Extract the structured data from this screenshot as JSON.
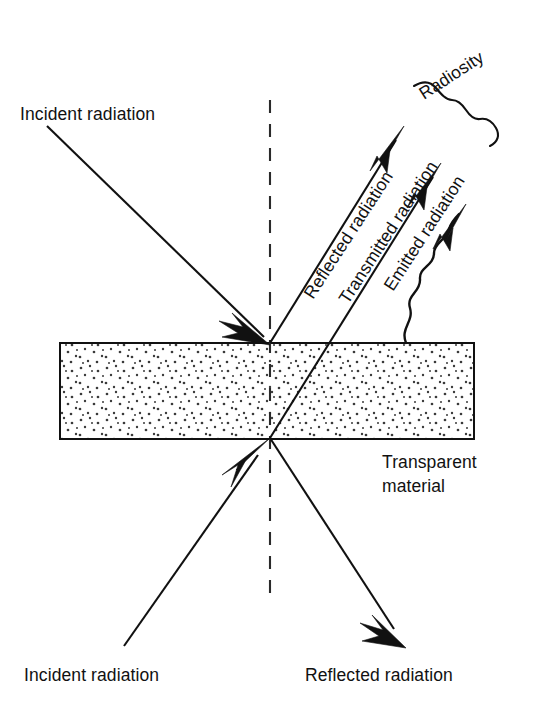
{
  "figure": {
    "background_color": "#ffffff",
    "ink_color": "#111111",
    "labels": {
      "incident_top": "Incident radiation",
      "incident_bottom": "Incident radiation",
      "reflected_top": "Reflected radiation",
      "transmitted": "Transmitted radiation",
      "emitted": "Emitted radiation",
      "radiosity": "Radiosity",
      "material_line1": "Transparent",
      "material_line2": "material",
      "reflected_bottom": "Reflected radiation"
    },
    "slab": {
      "name": "transparent-material-slab",
      "x": 60,
      "y": 343,
      "width": 414,
      "height": 96,
      "fill": "#ffffff",
      "stipple": "dotted"
    },
    "normal_line": {
      "name": "surface-normal-dashed",
      "x": 270,
      "y_top": 100,
      "y_bottom": 597,
      "style": "dashed"
    },
    "rays": [
      {
        "name": "incident-ray-top",
        "from": [
          47,
          126
        ],
        "to": [
          270,
          343
        ],
        "arrow": "at-end",
        "label": "Incident radiation"
      },
      {
        "name": "reflected-ray-top",
        "from": [
          270,
          343
        ],
        "to": [
          404,
          127
        ],
        "arrow": "at-end",
        "label": "Reflected radiation"
      },
      {
        "name": "transmitted-ray",
        "from": [
          270,
          438
        ],
        "to": [
          441,
          164
        ],
        "arrow": "at-end",
        "label": "Transmitted radiation"
      },
      {
        "name": "emitted-ray",
        "from": [
          406,
          343
        ],
        "to": [
          466,
          206
        ],
        "arrow": "at-end",
        "style": "wavy",
        "label": "Emitted radiation"
      },
      {
        "name": "incident-ray-bottom",
        "from": [
          124,
          646
        ],
        "to": [
          270,
          438
        ],
        "arrow": "at-end",
        "label": "Incident radiation"
      },
      {
        "name": "reflected-ray-bottom",
        "from": [
          270,
          438
        ],
        "to": [
          406,
          647
        ],
        "arrow": "at-end",
        "label": "Reflected radiation"
      }
    ],
    "brace": {
      "name": "radiosity-brace",
      "groups": [
        "Reflected radiation",
        "Transmitted radiation",
        "Emitted radiation"
      ],
      "label": "Radiosity"
    },
    "label_rotation_deg": -57
  }
}
